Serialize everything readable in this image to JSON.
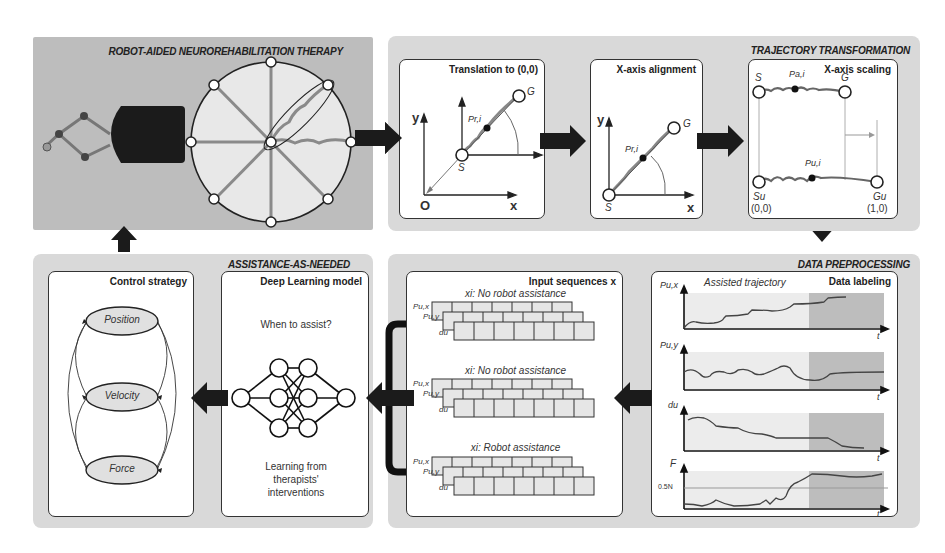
{
  "sections": {
    "therapy": {
      "title": "ROBOT-AIDED NEUROREHABILITATION THERAPY"
    },
    "trajectory": {
      "title": "TRAJECTORY TRANSFORMATION"
    },
    "assistance": {
      "title": "ASSISTANCE-AS-NEEDED"
    },
    "preprocessing": {
      "title": "DATA PREPROCESSING"
    }
  },
  "translation": {
    "title": "Translation to (0,0)",
    "y_axis": "y",
    "x_axis": "x",
    "origin": "O",
    "start": "S",
    "goal": "G",
    "point": "Pr,i"
  },
  "alignment": {
    "title": "X-axis alignment",
    "y_axis": "y",
    "x_axis": "x",
    "start": "S",
    "goal": "G",
    "point": "Pr,i"
  },
  "scaling": {
    "title": "X-axis scaling",
    "top_start": "S",
    "top_goal": "G",
    "top_point": "Pa,i",
    "bottom_point": "Pu,i",
    "bottom_start": "Su",
    "bottom_start_coord": "(0,0)",
    "bottom_goal": "Gu",
    "bottom_goal_coord": "(1,0)"
  },
  "control": {
    "title": "Control strategy",
    "states": [
      "Position",
      "Velocity",
      "Force"
    ]
  },
  "deep_learning": {
    "title": "Deep Learning model",
    "question": "When to assist?",
    "caption_line1": "Learning from",
    "caption_line2": "therapists'",
    "caption_line3": "interventions"
  },
  "input_sequences": {
    "title": "Input sequences x",
    "groups": [
      {
        "label": "xi: No robot assistance",
        "rows": [
          "Pu,x",
          "Pu,y",
          "du"
        ]
      },
      {
        "label": "xi: No robot assistance",
        "rows": [
          "Pu,x",
          "Pu,y",
          "du"
        ]
      },
      {
        "label": "xi: Robot assistance",
        "rows": [
          "Pu,x",
          "Pu,y",
          "du"
        ]
      }
    ]
  },
  "labeling": {
    "title": "Data labeling",
    "subtitle": "Assisted trajectory",
    "plots": [
      {
        "ylabel": "Pu,x",
        "xlabel": "t"
      },
      {
        "ylabel": "Pu,y",
        "xlabel": "t"
      },
      {
        "ylabel": "du",
        "xlabel": "t"
      },
      {
        "ylabel": "F",
        "xlabel": "t",
        "threshold": "0.5N"
      }
    ]
  }
}
